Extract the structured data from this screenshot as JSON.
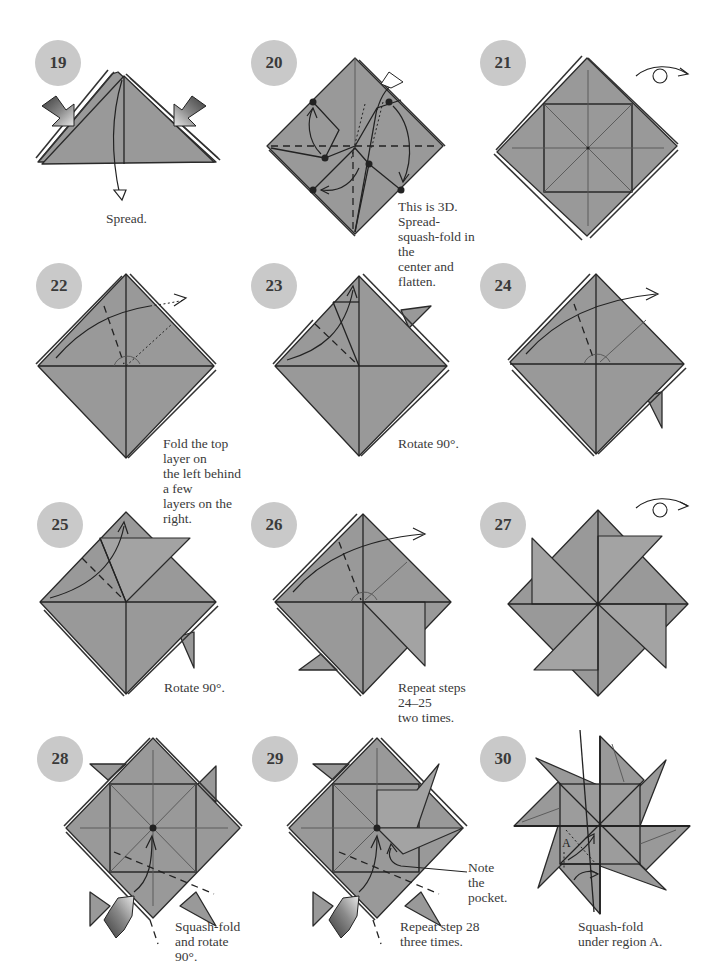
{
  "page": {
    "colors": {
      "paper": "#999999",
      "badge": "#c9c9c9",
      "ink": "#222222",
      "background": "#ffffff"
    }
  },
  "steps": [
    {
      "number": "19",
      "caption": [
        "Spread."
      ],
      "icons": [
        "push-arrow-icon",
        "push-arrow-icon",
        "open-arrow-icon"
      ]
    },
    {
      "number": "20",
      "caption": [
        "This is 3D. Spread-",
        "squash-fold in the",
        "center and flatten."
      ],
      "icons": [
        "valley-fold-arrow-icon",
        "reference-dot-icon"
      ]
    },
    {
      "number": "21",
      "caption": [],
      "icons": [
        "turn-over-icon"
      ]
    },
    {
      "number": "22",
      "caption": [
        "Fold the top layer on",
        "the left behind a few",
        "layers on the right."
      ],
      "icons": [
        "fold-behind-arrow-icon"
      ]
    },
    {
      "number": "23",
      "caption": [
        "Rotate 90°."
      ],
      "icons": [
        "valley-fold-arrow-icon"
      ]
    },
    {
      "number": "24",
      "caption": [],
      "icons": [
        "fold-behind-arrow-icon"
      ]
    },
    {
      "number": "25",
      "caption": [
        "Rotate 90°."
      ],
      "icons": [
        "valley-fold-arrow-icon"
      ]
    },
    {
      "number": "26",
      "caption": [
        "Repeat steps 24–25",
        "two times."
      ],
      "icons": [
        "fold-behind-arrow-icon"
      ]
    },
    {
      "number": "27",
      "caption": [],
      "icons": [
        "turn-over-icon"
      ]
    },
    {
      "number": "28",
      "caption": [
        "Squash-fold",
        "and rotate 90°."
      ],
      "icons": [
        "push-arrow-icon",
        "valley-fold-arrow-icon"
      ]
    },
    {
      "number": "29",
      "caption": [
        "Repeat step 28",
        "three times."
      ],
      "icons": [
        "push-arrow-icon",
        "valley-fold-arrow-icon"
      ],
      "callout": [
        "Note the",
        "pocket."
      ]
    },
    {
      "number": "30",
      "caption": [
        "Squash-fold",
        "under region A."
      ],
      "icons": [
        "valley-fold-arrow-icon"
      ],
      "region_label": "A"
    }
  ]
}
